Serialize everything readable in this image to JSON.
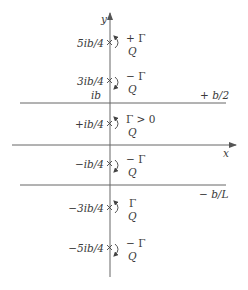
{
  "diagram": {
    "axes": {
      "x_label": "x",
      "y_label": "y",
      "y_axis_x": 110,
      "x_axis_y": 145
    },
    "boundaries": [
      {
        "label": "+ b/2",
        "y": 103
      },
      {
        "label": "− b/L",
        "y": 185
      }
    ],
    "ib_label": "ib",
    "vortices": [
      {
        "position": "5ib/4",
        "y": 43,
        "strength": "+ Γ",
        "source": "Q",
        "rotation": "counterclockwise"
      },
      {
        "position": "3ib/4",
        "y": 81,
        "strength": "− Γ",
        "source": "Q",
        "rotation": "clockwise"
      },
      {
        "position": "+ib/4",
        "y": 124,
        "strength": "Γ > 0",
        "source": "Q",
        "rotation": "counterclockwise"
      },
      {
        "position": "−ib/4",
        "y": 164,
        "strength": "− Γ",
        "source": "Q",
        "rotation": "clockwise"
      },
      {
        "position": "−3ib/4",
        "y": 208,
        "strength": "Γ",
        "source": "Q",
        "rotation": "counterclockwise"
      },
      {
        "position": "−5ib/4",
        "y": 248,
        "strength": "− Γ",
        "source": "Q",
        "rotation": "clockwise"
      }
    ],
    "colors": {
      "line": "#555555",
      "text": "#3a3a3a"
    }
  }
}
